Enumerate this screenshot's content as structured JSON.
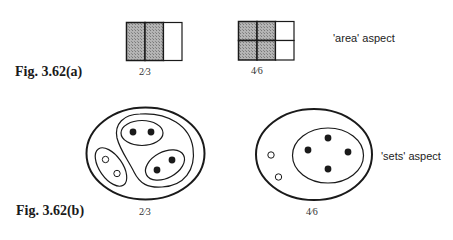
{
  "figures": {
    "a": {
      "label": "Fig. 3.62(a)",
      "aspect_label": "'area' aspect",
      "diagrams": [
        {
          "fraction": "2⁄3",
          "grid": {
            "rows": 1,
            "cols": 3,
            "shaded": 2
          }
        },
        {
          "fraction": "4⁄6",
          "grid": {
            "rows": 2,
            "cols": 3,
            "shaded": 4
          }
        }
      ]
    },
    "b": {
      "label": "Fig. 3.62(b)",
      "aspect_label": "'sets' aspect",
      "diagrams": [
        {
          "fraction": "2⁄3",
          "sets": {
            "groups": 3,
            "selected_groups": 2,
            "items_per_group": 2,
            "filled_items": 4,
            "empty_items": 2
          }
        },
        {
          "fraction": "4⁄6",
          "sets": {
            "subset_items": 4,
            "outside_items": 2
          }
        }
      ]
    }
  },
  "colors": {
    "stroke": "#1a1a1a",
    "shade": "#a8a8a8",
    "background": "#ffffff"
  }
}
